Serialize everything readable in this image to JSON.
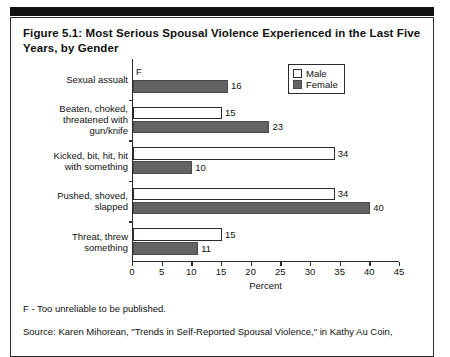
{
  "title": "Figure 5.1: Most Serious Spousal Violence Experienced in the Last Five Years, by Gender",
  "footnote": "F - Too unreliable to be published.",
  "source": "Source: Karen Mihorean, \"Trends in Self-Reported Spousal Violence,\" in Kathy Au Coin,",
  "legend": {
    "male_label": "Male",
    "female_label": "Female"
  },
  "colors": {
    "male": "#ffffff",
    "female": "#636363",
    "axis": "#2b2b2b",
    "rule": "#111111"
  },
  "chart_data": {
    "type": "bar",
    "orientation": "horizontal",
    "title": "Figure 5.1: Most Serious Spousal Violence Experienced in the Last Five Years, by Gender",
    "categories": [
      "Sexual assualt",
      "Beaten, choked, threatened with gun/knife",
      "Kicked, bit, hit, hit with something",
      "Pushed, shoved, slapped",
      "Threat, threw something"
    ],
    "category_lines": [
      [
        "Sexual assualt"
      ],
      [
        "Beaten, choked,",
        "threatened with",
        "gun/knife"
      ],
      [
        "Kicked, bit, hit, hit",
        "with something"
      ],
      [
        "Pushed, shoved,",
        "slapped"
      ],
      [
        "Threat, threw",
        "something"
      ]
    ],
    "series": [
      {
        "name": "Male",
        "values": [
          null,
          15,
          34,
          34,
          15
        ],
        "labels": [
          "F",
          "15",
          "34",
          "34",
          "15"
        ]
      },
      {
        "name": "Female",
        "values": [
          16,
          23,
          10,
          40,
          11
        ],
        "labels": [
          "16",
          "23",
          "10",
          "40",
          "11"
        ]
      }
    ],
    "xlabel": "Percent",
    "ylabel": "",
    "xlim": [
      0,
      45
    ],
    "xticks": [
      0,
      5,
      10,
      15,
      20,
      25,
      30,
      35,
      40,
      45
    ],
    "xtick_labels": [
      "0",
      "5",
      "10",
      "15",
      "20",
      "25",
      "30",
      "35",
      "40",
      "45"
    ],
    "grid": false,
    "legend_position": "top-right"
  }
}
